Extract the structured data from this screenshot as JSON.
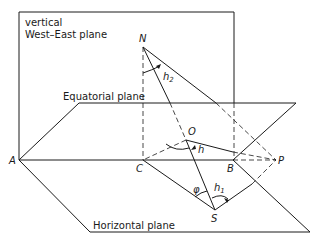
{
  "planes": {
    "vertical_line1": "vertical",
    "vertical_line2": "West–East plane",
    "equatorial": "Equatorial plane",
    "horizontal": "Horizontal plane"
  },
  "points": {
    "A": "A",
    "B": "B",
    "C": "C",
    "N": "N",
    "O": "O",
    "P": "P",
    "S": "S"
  },
  "angles": {
    "h": "h",
    "h1_base": "h",
    "h1_sub": "1",
    "h2_base": "h",
    "h2_sub": "2",
    "phi": "φ"
  },
  "colors": {
    "ink": "#1a1a1a",
    "background": "#ffffff"
  }
}
